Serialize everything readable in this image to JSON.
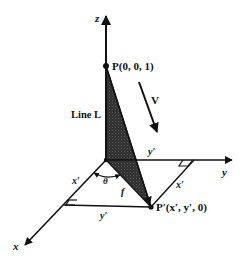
{
  "figure": {
    "type": "3D coordinate projection diagram",
    "colors": {
      "ink": "#111111",
      "shade": "#3a3a3a",
      "background": "#ffffff"
    },
    "axes": {
      "x_label": "x",
      "y_label": "y",
      "z_label": "z"
    },
    "points": {
      "P_label": "P(0, 0, 1)",
      "P_prime_label": "P′(x′, y′, 0)"
    },
    "labels": {
      "line": "Line L",
      "vector": "V",
      "y_prime_top": "y′",
      "y_prime_bottom": "y′",
      "x_prime_left": "x′",
      "x_prime_right": "x′",
      "theta": "θ",
      "f": "f"
    }
  }
}
